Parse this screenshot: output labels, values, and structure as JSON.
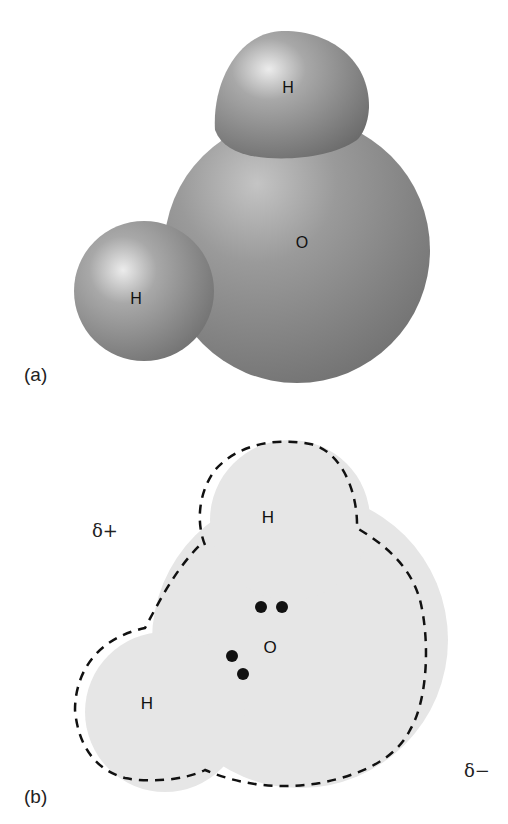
{
  "figure": {
    "panel_a": {
      "label": "(a)",
      "description": "Space-filling model of a water molecule",
      "atoms": [
        {
          "symbol": "H",
          "position": "top"
        },
        {
          "symbol": "O",
          "position": "center"
        },
        {
          "symbol": "H",
          "position": "left"
        }
      ]
    },
    "panel_b": {
      "label": "(b)",
      "description": "Electron cloud outline with lone pairs",
      "atoms": [
        {
          "symbol": "H",
          "position": "top"
        },
        {
          "symbol": "O",
          "position": "center"
        },
        {
          "symbol": "H",
          "position": "left"
        }
      ],
      "charges": {
        "positive": "δ+",
        "negative": "δ−"
      },
      "lone_pairs": 2
    }
  },
  "colors": {
    "sphere_base": "#8a8a8a",
    "sphere_highlight": "#e8e8e8",
    "cloud_fill": "#e6e6e6",
    "outline": "#111111"
  }
}
